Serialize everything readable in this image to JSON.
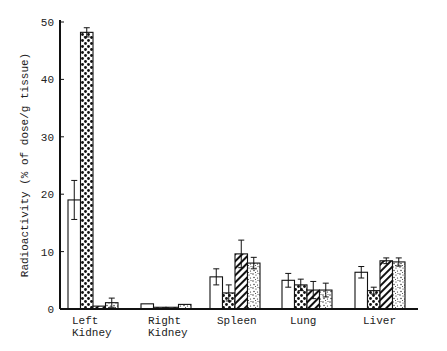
{
  "chart_data": {
    "type": "bar",
    "title": "",
    "xlabel": "",
    "ylabel": "Radioactivity (% of dose/g tissue)",
    "ylim": [
      0,
      50
    ],
    "yticks": [
      0,
      10,
      20,
      30,
      40,
      50
    ],
    "ytick_labels": [
      "0",
      "10",
      "20",
      "30",
      "40",
      "50"
    ],
    "grid": false,
    "legend": null,
    "categories": [
      {
        "line1": "Left",
        "line2": "Kidney"
      },
      {
        "line1": "Right",
        "line2": "Kidney"
      },
      {
        "line1": "Spleen",
        "line2": ""
      },
      {
        "line1": "Lung",
        "line2": ""
      },
      {
        "line1": "Liver",
        "line2": ""
      }
    ],
    "series": [
      {
        "name": "open",
        "pattern": "open",
        "values": [
          19.0,
          0.9,
          5.6,
          5.0,
          6.4
        ],
        "errors": [
          3.4,
          0,
          1.4,
          1.2,
          1.0
        ]
      },
      {
        "name": "dotted",
        "pattern": "dots",
        "values": [
          48.2,
          0.3,
          2.8,
          4.2,
          3.2
        ],
        "errors": [
          0.8,
          0,
          1.4,
          1.0,
          0.6
        ]
      },
      {
        "name": "hatched",
        "pattern": "hatch",
        "values": [
          0.5,
          0.3,
          9.6,
          3.3,
          8.4
        ],
        "errors": [
          0,
          0,
          2.4,
          1.5,
          0.5
        ]
      },
      {
        "name": "speckled",
        "pattern": "speckle",
        "values": [
          1.1,
          0.8,
          8.0,
          3.3,
          8.2
        ],
        "errors": [
          0.8,
          0,
          1.0,
          1.2,
          0.7
        ]
      }
    ]
  }
}
